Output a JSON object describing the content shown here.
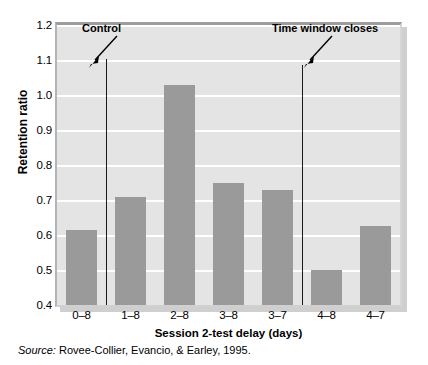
{
  "chart_data": {
    "type": "bar",
    "title": "",
    "xlabel": "Session 2-test delay (days)",
    "ylabel": "Retention ratio",
    "categories": [
      "0–8",
      "1–8",
      "2–8",
      "3–8",
      "3–7",
      "4–8",
      "4–7"
    ],
    "values": [
      0.615,
      0.71,
      1.03,
      0.75,
      0.73,
      0.5,
      0.625
    ],
    "ylim": [
      0.4,
      1.2
    ],
    "ytick_values": [
      0.4,
      0.5,
      0.6,
      0.7,
      0.8,
      0.9,
      1.0,
      1.1,
      1.2
    ],
    "ytick_labels": [
      "0.4",
      "0.5",
      "0.6",
      "0.7",
      "0.8",
      "0.9",
      "1.0",
      "1.1",
      "1.2"
    ],
    "grid": "horizontal-white-on-gray",
    "legend": "none",
    "bar_color": "#9a9a9a",
    "plot_background": "#e4e4e4",
    "gridline_color": "#ffffff",
    "annotations": [
      {
        "name": "control",
        "label": "Control",
        "marker": "vertical-line",
        "between_categories": [
          "0–8",
          "1–8"
        ],
        "arrow": "down-left"
      },
      {
        "name": "time-window-closes",
        "label": "Time window closes",
        "marker": "vertical-line",
        "between_categories": [
          "3–7",
          "4–8"
        ],
        "arrow": "down-left"
      }
    ]
  },
  "source": {
    "prefix": "Source:",
    "text": "Rovee-Collier, Evancio, & Earley, 1995."
  }
}
